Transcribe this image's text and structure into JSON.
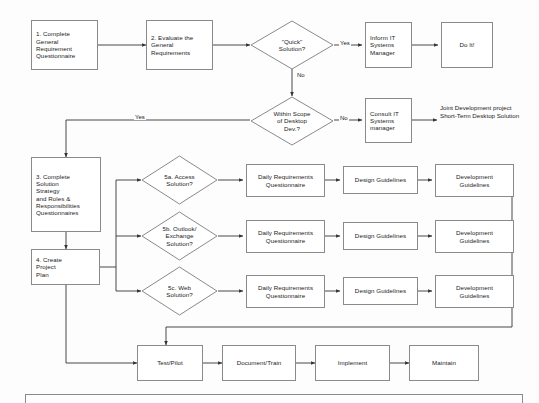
{
  "diagram": {
    "type": "flowchart",
    "stroke_color": "#8a8a8a",
    "wire_color": "#333333",
    "text_color": "#1b1b1b",
    "background": "#fdfdfd"
  },
  "nodes": {
    "step1": "1. Complete\nGeneral\nRequirement\nQuestionnaire",
    "step2": "2. Evaluate the\nGeneral\nRequirements",
    "quick_decision": "\"Quick\"\nSolution?",
    "inform_it": "Inform IT\nSystems\nManager",
    "do_it": "Do It!",
    "scope_decision": "Within Scope\nof Desktop\nDev.?",
    "consult_it": "Consult IT\nSystems\nmanager",
    "step3": "3. Complete\nSolution\nStrategy\nand Roles &\nResponsibilities\nQuestionnaires",
    "step4": "4. Create\nProject\nPlan",
    "dec_5a": "5a. Access\nSolution?",
    "dec_5b": "5b. Outlook/\nExchange\nSolution?",
    "dec_5c": "5c. Web\nSolution?",
    "daily_req_a": "Daily Requirements\nQuestionnaire",
    "daily_req_b": "Daily Requirements\nQuestionnaire",
    "daily_req_c": "Daily Requirements\nQuestionnaire",
    "design_a": "Design Guidelines",
    "design_b": "Design Guidelines",
    "design_c": "Design Guidelines",
    "dev_a": "Development\nGuidelines",
    "dev_b": "Development\nGuidelines",
    "dev_c": "Development\nGuidelines",
    "test_pilot": "Test/Pilot",
    "document_train": "Document/Train",
    "implement": "Implement",
    "maintain": "Maintain"
  },
  "edge_labels": {
    "quick_yes": "Yes",
    "quick_no": "No",
    "scope_yes": "Yes",
    "scope_no": "No"
  },
  "outcome_bullets": [
    "Joint Development project",
    "Short-Term Desktop Solution"
  ]
}
